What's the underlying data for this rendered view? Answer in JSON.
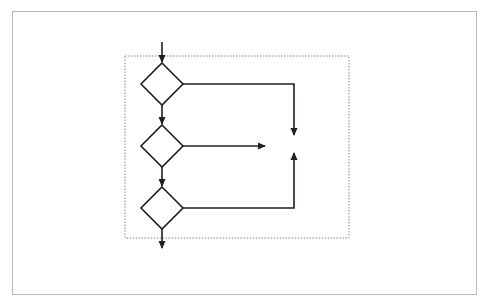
{
  "diagram": {
    "container_label": "IIS",
    "nodes": {
      "start": "HTTP request",
      "error": "40X error\nreturned",
      "denied": "Access denied",
      "end": "Return content\nor launch\napplication"
    },
    "decisions": [
      {
        "question": "IP address and domain\nname permitted?",
        "yes": "Yes",
        "no": "No"
      },
      {
        "question": "HTTP verb\nallowed?",
        "yes": "Yes",
        "no": "No"
      },
      {
        "question": "User\nauthenticated?",
        "yes": "Yes",
        "no": "No"
      }
    ],
    "colors": {
      "stroke": "#231f20",
      "frame": "#b8b8b8",
      "dashed": "#8a8a8a"
    }
  }
}
